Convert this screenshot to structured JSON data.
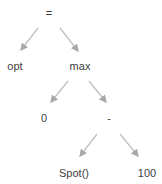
{
  "diagram": {
    "type": "expression-tree",
    "nodes": [
      {
        "id": "n0",
        "label": "=",
        "x": 49,
        "y": 7
      },
      {
        "id": "n1",
        "label": "opt",
        "x": 15,
        "y": 60
      },
      {
        "id": "n2",
        "label": "max",
        "x": 80,
        "y": 60
      },
      {
        "id": "n3",
        "label": "0",
        "x": 44,
        "y": 112
      },
      {
        "id": "n4",
        "label": "-",
        "x": 109,
        "y": 112
      },
      {
        "id": "n5",
        "label": "Spot()",
        "x": 74,
        "y": 167
      },
      {
        "id": "n6",
        "label": "100",
        "x": 147,
        "y": 167
      }
    ],
    "edges": [
      {
        "from": "n0",
        "to": "n1"
      },
      {
        "from": "n0",
        "to": "n2"
      },
      {
        "from": "n2",
        "to": "n3"
      },
      {
        "from": "n2",
        "to": "n4"
      },
      {
        "from": "n4",
        "to": "n5"
      },
      {
        "from": "n4",
        "to": "n6"
      }
    ],
    "colors": {
      "edge": "#c0c0c0",
      "text": "#404040"
    }
  }
}
